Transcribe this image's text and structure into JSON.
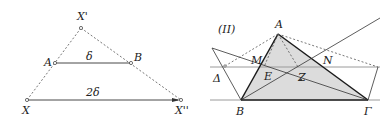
{
  "colors": {
    "line": "#333333",
    "thick_line": "#1a1a1a",
    "gray_line": "#9a9a9a",
    "fill": "#dcdcdc",
    "dashed": "#555555"
  },
  "left_figure": {
    "points": {
      "Xp": {
        "label": "X'",
        "x": 81,
        "y": 28
      },
      "A": {
        "label": "A",
        "x": 55,
        "y": 63
      },
      "B": {
        "label": "B",
        "x": 131,
        "y": 63
      },
      "X": {
        "label": "X",
        "x": 27,
        "y": 100
      },
      "Xpp": {
        "label": "X''",
        "x": 181,
        "y": 100
      }
    },
    "segment_labels": {
      "AB": "δ",
      "XXpp": "2δ"
    }
  },
  "right_figure": {
    "title": "(II)",
    "points": {
      "A": {
        "label": "A",
        "x": 278,
        "y": 34
      },
      "B": {
        "label": "B",
        "x": 241,
        "y": 100
      },
      "Gamma": {
        "label": "Γ",
        "x": 368,
        "y": 100
      },
      "Delta": {
        "label": "Δ",
        "x": 225,
        "y": 66
      },
      "M": {
        "label": "M",
        "x": 261,
        "y": 66
      },
      "N": {
        "label": "N",
        "x": 313,
        "y": 66
      },
      "E": {
        "label": "E",
        "x": 264,
        "y": 76
      },
      "Z": {
        "label": "Z",
        "x": 301,
        "y": 80
      }
    }
  }
}
